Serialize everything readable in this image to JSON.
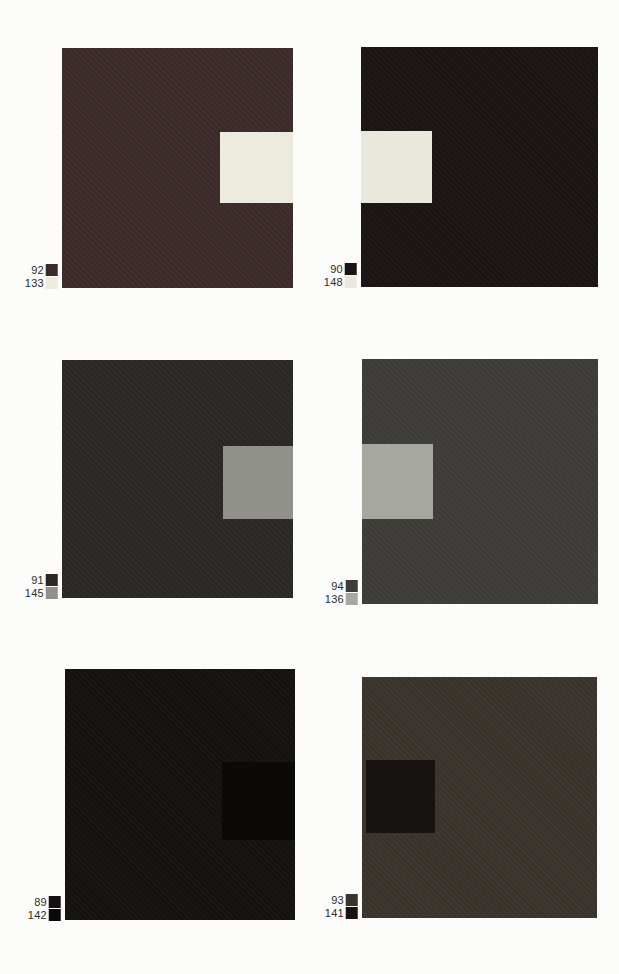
{
  "page": {
    "background": "#fcfcfa"
  },
  "panels": [
    {
      "name": "top-left",
      "ground_label": "92",
      "figure_label": "133",
      "ground_color": "#3c2a2a",
      "figure_color": "#edebde",
      "figure_side": "right"
    },
    {
      "name": "top-right",
      "ground_label": "90",
      "figure_label": "148",
      "ground_color": "#1a1414",
      "figure_color": "#eae8dd",
      "figure_side": "left"
    },
    {
      "name": "middle-left",
      "ground_label": "91",
      "figure_label": "145",
      "ground_color": "#2b2726",
      "figure_color": "#8f918a",
      "figure_side": "right"
    },
    {
      "name": "middle-right",
      "ground_label": "94",
      "figure_label": "136",
      "ground_color": "#3d3c39",
      "figure_color": "#a6a79e",
      "figure_side": "left"
    },
    {
      "name": "bottom-left",
      "ground_label": "89",
      "figure_label": "142",
      "ground_color": "#141110",
      "figure_color": "#0b0a09",
      "figure_side": "right"
    },
    {
      "name": "bottom-right",
      "ground_label": "93",
      "figure_label": "141",
      "ground_color": "#3a332c",
      "figure_color": "#171310",
      "figure_side": "left-inset"
    }
  ]
}
